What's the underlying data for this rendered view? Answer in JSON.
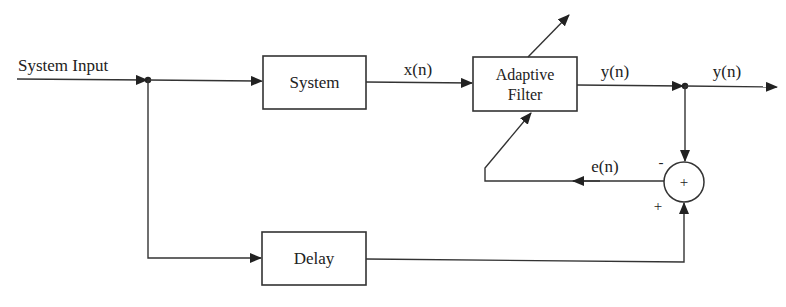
{
  "diagram": {
    "colors": {
      "line": "#333333",
      "text": "#222222",
      "background": "#ffffff"
    },
    "input_label": "System Input",
    "blocks": [
      {
        "id": "system",
        "label": "System"
      },
      {
        "id": "adaptive_filter",
        "label_line1": "Adaptive",
        "label_line2": "Filter"
      },
      {
        "id": "delay",
        "label": "Delay"
      }
    ],
    "summing_junction": {
      "symbol": "+",
      "input_minus": "-",
      "input_plus": "+"
    },
    "signals": {
      "x": "x(n)",
      "y_internal": "y(n)",
      "y_output": "y(n)",
      "e": "e(n)"
    }
  }
}
